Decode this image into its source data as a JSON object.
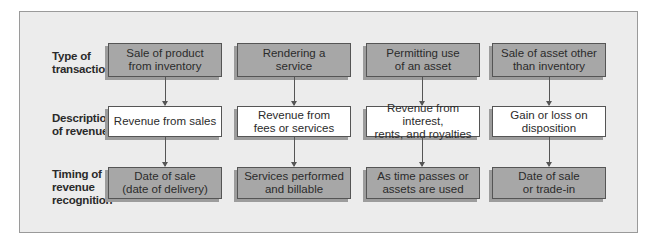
{
  "row_labels": [
    "Type of\ntransaction",
    "Description\nof revenue",
    "Timing of\nrevenue\nrecognition"
  ],
  "columns": [
    {
      "type": "Sale of product\nfrom inventory",
      "description": "Revenue from sales",
      "timing": "Date of sale\n(date of delivery)"
    },
    {
      "type": "Rendering a\nservice",
      "description": "Revenue from\nfees or services",
      "timing": "Services performed\nand billable"
    },
    {
      "type": "Permitting use\nof an asset",
      "description": "Revenue from interest,\nrents, and royalties",
      "timing": "As time passes or\nassets are used"
    },
    {
      "type": "Sale of asset other\nthan inventory",
      "description": "Gain or loss on\ndisposition",
      "timing": "Date of sale\nor trade-in"
    }
  ],
  "colors": {
    "panel_background": "#ececec",
    "grey_box": "#a7a7a7",
    "white_box": "#ffffff",
    "border": "#555555",
    "shadow": "#9c9c9c"
  }
}
